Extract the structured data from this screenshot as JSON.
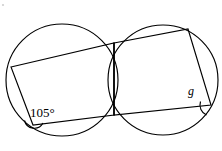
{
  "figure": {
    "canvas": {
      "width": 222,
      "height": 151,
      "background": "#ffffff"
    },
    "stroke_color": "#000000",
    "stroke_width": 1.15
  },
  "circles": [
    {
      "name": "left-circle",
      "cx": 62,
      "cy": 80,
      "r": 56
    },
    {
      "name": "right-circle",
      "cx": 163,
      "cy": 80,
      "r": 55
    }
  ],
  "intersection_points": [
    {
      "name": "upper-intersection",
      "x": 114,
      "y": 43
    },
    {
      "name": "lower-intersection",
      "x": 114,
      "y": 115
    }
  ],
  "chord": {
    "name": "common-chord",
    "x1": 114,
    "y1": 43,
    "x2": 114,
    "y2": 115
  },
  "left_quadrilateral": {
    "name": "left-inscribed-quadrilateral",
    "points": "11,67 114,43 114,115 33,125",
    "vertices": [
      {
        "name": "left-quad-top-left",
        "x": 11,
        "y": 67
      },
      {
        "name": "left-quad-top-right",
        "x": 114,
        "y": 43
      },
      {
        "name": "left-quad-bottom-right",
        "x": 114,
        "y": 115
      },
      {
        "name": "left-quad-bottom-left",
        "x": 33,
        "y": 125
      }
    ]
  },
  "right_quadrilateral": {
    "name": "right-inscribed-quadrilateral",
    "points": "114,43 188,29 211,105 114,115",
    "vertices": [
      {
        "name": "right-quad-top-left",
        "x": 114,
        "y": 43
      },
      {
        "name": "right-quad-top-right",
        "x": 188,
        "y": 29
      },
      {
        "name": "right-quad-bottom-right",
        "x": 211,
        "y": 105
      },
      {
        "name": "right-quad-bottom-left",
        "x": 114,
        "y": 115
      }
    ]
  },
  "angles": [
    {
      "name": "angle-105",
      "label": "105°",
      "value": 105,
      "unit": "degrees",
      "vertex": {
        "x": 33,
        "y": 125
      },
      "label_x": 30,
      "label_y": 117,
      "arc_path": "M 24.5 120.5 A 10 10 0 0 0 43 123"
    },
    {
      "name": "angle-g",
      "label": "g",
      "value": null,
      "unit": "degrees",
      "vertex": {
        "x": 211,
        "y": 105
      },
      "label_x": 188,
      "label_y": 95,
      "arc_path": "M 200.5 101.5 A 11 11 0 0 0 206.5 115"
    }
  ],
  "speck": {
    "x": 3,
    "y": 5,
    "r": 1.1
  }
}
